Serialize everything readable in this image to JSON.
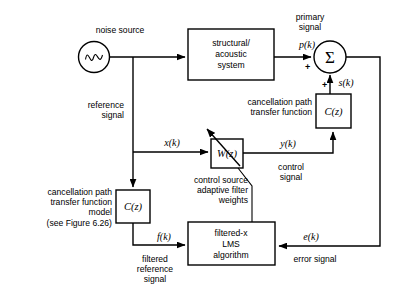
{
  "figure": {
    "background": "#ffffff",
    "line_color": "#000000"
  },
  "blocks": {
    "noise_source": {
      "label": "noise source",
      "icon": "sine-wave-icon"
    },
    "plant": {
      "line1": "structural/",
      "line2": "acoustic",
      "line3": "system"
    },
    "summing_junction": {
      "symbol": "Σ",
      "sign_primary": "+",
      "sign_secondary": "+"
    },
    "cancellation_path": {
      "label_line1": "cancellation path",
      "label_line2": "transfer function",
      "transfer": "C(z)"
    },
    "adaptive_filter": {
      "transfer": "W(z)",
      "label_line1": "control source",
      "label_line2": "adaptive filter",
      "label_line3": "weights"
    },
    "cancellation_path_model": {
      "label_line1": "cancellation path",
      "label_line2": "transfer function",
      "label_line3": "model",
      "label_line4": "(see Figure 6.26)",
      "transfer": "C(z)"
    },
    "lms": {
      "line1": "filtered-x",
      "line2": "LMS",
      "line3": "algorithm"
    }
  },
  "signals": {
    "reference": {
      "name": "reference",
      "name2": "signal",
      "symbol": "x(k)"
    },
    "primary": {
      "name": "primary",
      "name2": "signal",
      "symbol": "p(k)"
    },
    "cancelling": {
      "symbol": "s(k)"
    },
    "control": {
      "symbol": "y(k)",
      "name": "control",
      "name2": "signal"
    },
    "filtered_reference": {
      "symbol": "f(k)",
      "name": "filtered",
      "name2": "reference",
      "name3": "signal"
    },
    "error": {
      "symbol": "e(k)",
      "name": "error  signal"
    }
  }
}
